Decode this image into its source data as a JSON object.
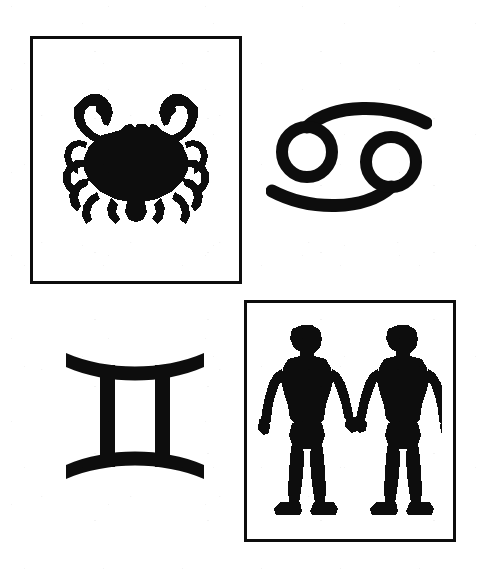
{
  "page": {
    "width": 485,
    "height": 574,
    "background_color": "#ffffff",
    "ink_color": "#0d0d0d"
  },
  "cells": [
    {
      "id": "crab",
      "position": "top-left",
      "kind": "framed-pictogram",
      "name": "crab-illustration",
      "label": "Crab",
      "sign": "Cancer",
      "framed": true,
      "frame_color": "#0d0d0d",
      "frame_width_px": 3,
      "ink_color": "#0d0d0d",
      "bounds": {
        "x": 30,
        "y": 36,
        "width": 212,
        "height": 248
      }
    },
    {
      "id": "cancer-glyph",
      "position": "top-right",
      "kind": "glyph",
      "name": "cancer-glyph",
      "label": "Cancer",
      "sign": "Cancer",
      "unicode": "♋",
      "framed": false,
      "ink_color": "#0d0d0d",
      "bounds": {
        "x": 266,
        "y": 92,
        "width": 166,
        "height": 130
      }
    },
    {
      "id": "gemini-glyph",
      "position": "bottom-left",
      "kind": "glyph",
      "name": "gemini-glyph",
      "label": "Gemini",
      "sign": "Gemini",
      "unicode": "♊",
      "framed": false,
      "ink_color": "#0d0d0d",
      "bounds": {
        "x": 62,
        "y": 345,
        "width": 146,
        "height": 142
      }
    },
    {
      "id": "twins",
      "position": "bottom-right",
      "kind": "framed-pictogram",
      "name": "twins-illustration",
      "label": "Twins",
      "sign": "Gemini",
      "framed": true,
      "frame_color": "#0d0d0d",
      "frame_width_px": 3,
      "ink_color": "#0d0d0d",
      "bounds": {
        "x": 244,
        "y": 300,
        "width": 212,
        "height": 242
      }
    }
  ]
}
